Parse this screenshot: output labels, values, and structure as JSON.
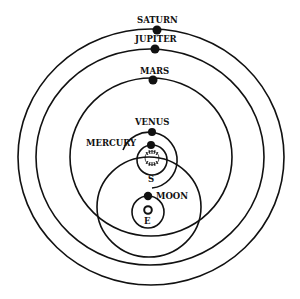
{
  "diagram": {
    "colors": {
      "ink": "#111111",
      "background": "#ffffff"
    },
    "labels": {
      "saturn": "SATURN",
      "jupiter": "JUPITER",
      "mars": "MARS",
      "venus": "VENUS",
      "mercury": "MERCURY",
      "sun": "S",
      "moon": "MOON",
      "earth": "E"
    },
    "bodies": [
      {
        "name": "Saturn",
        "orbits": "Sun"
      },
      {
        "name": "Jupiter",
        "orbits": "Sun"
      },
      {
        "name": "Mars",
        "orbits": "Sun"
      },
      {
        "name": "Venus",
        "orbits": "Sun"
      },
      {
        "name": "Mercury",
        "orbits": "Sun"
      },
      {
        "name": "Sun",
        "orbits": "Earth"
      },
      {
        "name": "Moon",
        "orbits": "Earth"
      },
      {
        "name": "Earth",
        "orbits": null
      }
    ]
  }
}
